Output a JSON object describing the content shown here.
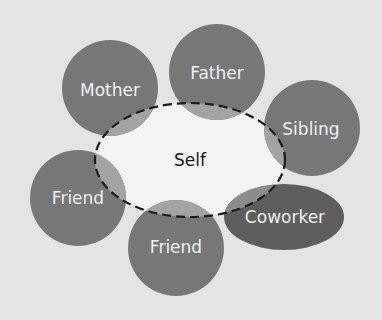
{
  "diagram": {
    "type": "social-network-circles",
    "colors": {
      "background": "#e4e4e4",
      "node_fill": "#777777",
      "coworker_fill": "#5e5e5e",
      "overlap_fill": "#a3a3a3",
      "self_fill": "#f4f4f4",
      "self_border": "#1a1a1a",
      "node_text": "#f2f2f2",
      "self_text": "#1a1a1a"
    },
    "center": {
      "label": "Self",
      "cx": 190,
      "cy": 160,
      "rx": 95,
      "ry": 57,
      "border": "dashed"
    },
    "nodes": [
      {
        "label": "Mother",
        "shape": "circle",
        "cx": 110,
        "cy": 88,
        "r": 48
      },
      {
        "label": "Father",
        "shape": "circle",
        "cx": 217,
        "cy": 72,
        "r": 48
      },
      {
        "label": "Sibling",
        "shape": "circle",
        "cx": 312,
        "cy": 128,
        "r": 48
      },
      {
        "label": "Friend",
        "shape": "circle",
        "cx": 78,
        "cy": 198,
        "r": 48
      },
      {
        "label": "Friend",
        "shape": "circle",
        "cx": 176,
        "cy": 248,
        "r": 48
      },
      {
        "label": "Coworker",
        "shape": "ellipse",
        "cx": 284,
        "cy": 217,
        "rx": 60,
        "ry": 33
      }
    ]
  }
}
